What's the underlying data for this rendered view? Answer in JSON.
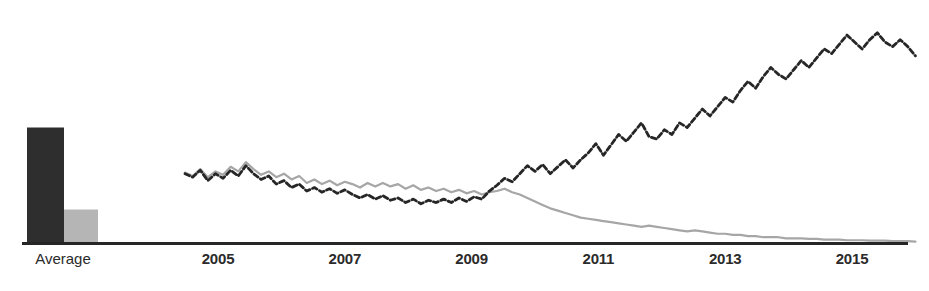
{
  "chart_data": {
    "type": "line",
    "title": "",
    "subtitle": "",
    "xlabel": "",
    "ylabel": "",
    "grid": false,
    "legend_position": "none",
    "xlim": [
      2004.0,
      2016.3
    ],
    "ylim": [
      0,
      100
    ],
    "axis_line_color": "#262626",
    "colors": {
      "series_dark": "#262626",
      "series_light": "#a6a6a6",
      "bar_dark": "#2e2e2e",
      "bar_light": "#b5b5b5",
      "axis": "#262626",
      "text": "#2b2b2b"
    },
    "x_tick_labels": [
      "2005",
      "2007",
      "2009",
      "2011",
      "2013",
      "2015"
    ],
    "x_tick_values": [
      2005,
      2007,
      2009,
      2011,
      2013,
      2015
    ],
    "category_labels": [
      "Average"
    ],
    "bars": {
      "name": "Average",
      "categories": [
        "Average"
      ],
      "series": [
        {
          "name": "Dark series average",
          "values": [
            50.0
          ]
        },
        {
          "name": "Light series average",
          "values": [
            14.5
          ]
        }
      ]
    },
    "series": [
      {
        "name": "Dark dashed series",
        "style": "dashed",
        "color": "#262626",
        "x": [
          2004.48,
          2004.6,
          2004.72,
          2004.84,
          2004.96,
          2005.08,
          2005.2,
          2005.32,
          2005.44,
          2005.56,
          2005.68,
          2005.8,
          2005.92,
          2006.04,
          2006.16,
          2006.28,
          2006.4,
          2006.52,
          2006.64,
          2006.76,
          2006.88,
          2007.0,
          2007.12,
          2007.24,
          2007.36,
          2007.48,
          2007.6,
          2007.72,
          2007.84,
          2007.96,
          2008.08,
          2008.2,
          2008.32,
          2008.44,
          2008.56,
          2008.68,
          2008.8,
          2008.92,
          2009.04,
          2009.16,
          2009.28,
          2009.4,
          2009.52,
          2009.64,
          2009.76,
          2009.88,
          2010.0,
          2010.12,
          2010.24,
          2010.36,
          2010.48,
          2010.6,
          2010.72,
          2010.84,
          2010.96,
          2011.08,
          2011.2,
          2011.32,
          2011.44,
          2011.56,
          2011.68,
          2011.8,
          2011.92,
          2012.04,
          2012.16,
          2012.28,
          2012.4,
          2012.52,
          2012.64,
          2012.76,
          2012.88,
          2013.0,
          2013.12,
          2013.24,
          2013.36,
          2013.48,
          2013.6,
          2013.72,
          2013.84,
          2013.96,
          2014.08,
          2014.2,
          2014.32,
          2014.44,
          2014.56,
          2014.68,
          2014.8,
          2014.92,
          2015.04,
          2015.16,
          2015.28,
          2015.4,
          2015.52,
          2015.64,
          2015.76,
          2015.88,
          2016.0
        ],
        "y": [
          30.0,
          28.5,
          31.5,
          27.0,
          30.0,
          28.0,
          31.5,
          29.0,
          33.5,
          30.0,
          27.5,
          29.0,
          25.5,
          27.0,
          24.0,
          25.5,
          22.5,
          24.0,
          22.0,
          23.5,
          21.5,
          23.0,
          21.0,
          19.5,
          21.0,
          19.0,
          20.5,
          18.5,
          19.5,
          17.5,
          19.0,
          17.0,
          18.5,
          17.5,
          19.0,
          17.5,
          19.5,
          18.0,
          20.0,
          19.0,
          22.5,
          25.0,
          28.0,
          26.5,
          30.0,
          33.5,
          31.0,
          34.0,
          30.0,
          33.0,
          36.0,
          32.5,
          36.0,
          39.0,
          43.0,
          38.0,
          42.5,
          47.0,
          44.0,
          48.0,
          52.0,
          46.0,
          45.0,
          49.0,
          47.0,
          52.0,
          50.0,
          54.0,
          58.0,
          55.0,
          59.0,
          63.0,
          61.0,
          66.0,
          70.0,
          67.0,
          72.0,
          76.0,
          73.0,
          71.0,
          75.0,
          79.0,
          76.0,
          80.0,
          84.0,
          82.0,
          86.0,
          90.0,
          87.0,
          84.0,
          88.0,
          91.0,
          87.0,
          85.0,
          88.0,
          85.0,
          81.0
        ]
      },
      {
        "name": "Light solid series",
        "style": "solid",
        "color": "#a6a6a6",
        "x": [
          2004.48,
          2004.6,
          2004.72,
          2004.84,
          2004.96,
          2005.08,
          2005.2,
          2005.32,
          2005.44,
          2005.56,
          2005.68,
          2005.8,
          2005.92,
          2006.04,
          2006.16,
          2006.28,
          2006.4,
          2006.52,
          2006.64,
          2006.76,
          2006.88,
          2007.0,
          2007.12,
          2007.24,
          2007.36,
          2007.48,
          2007.6,
          2007.72,
          2007.84,
          2007.96,
          2008.08,
          2008.2,
          2008.32,
          2008.44,
          2008.56,
          2008.68,
          2008.8,
          2008.92,
          2009.04,
          2009.16,
          2009.28,
          2009.4,
          2009.52,
          2009.64,
          2009.76,
          2009.88,
          2010.0,
          2010.12,
          2010.24,
          2010.36,
          2010.48,
          2010.6,
          2010.72,
          2010.84,
          2010.96,
          2011.08,
          2011.2,
          2011.32,
          2011.44,
          2011.56,
          2011.68,
          2011.8,
          2011.92,
          2012.04,
          2012.16,
          2012.28,
          2012.4,
          2012.52,
          2012.64,
          2012.76,
          2012.88,
          2013.0,
          2013.12,
          2013.24,
          2013.36,
          2013.48,
          2013.6,
          2013.72,
          2013.84,
          2013.96,
          2014.08,
          2014.2,
          2014.32,
          2014.44,
          2014.56,
          2014.68,
          2014.8,
          2014.92,
          2015.04,
          2015.16,
          2015.28,
          2015.4,
          2015.52,
          2015.64,
          2015.76,
          2015.88,
          2016.0
        ],
        "y": [
          30.5,
          29.0,
          32.0,
          28.5,
          31.0,
          29.5,
          33.0,
          31.0,
          35.0,
          32.0,
          29.5,
          31.0,
          28.5,
          30.0,
          27.5,
          29.0,
          26.0,
          27.5,
          25.5,
          27.0,
          25.0,
          26.5,
          25.5,
          24.0,
          26.0,
          24.5,
          26.0,
          24.5,
          25.5,
          23.5,
          25.0,
          23.0,
          24.0,
          22.5,
          23.5,
          22.0,
          23.0,
          21.5,
          22.5,
          21.0,
          22.0,
          22.5,
          23.5,
          22.0,
          21.0,
          19.5,
          18.0,
          16.5,
          15.0,
          14.0,
          13.0,
          12.0,
          11.0,
          10.5,
          10.0,
          9.5,
          9.0,
          8.5,
          8.0,
          7.5,
          7.0,
          7.5,
          7.0,
          6.5,
          6.0,
          5.5,
          5.0,
          5.5,
          5.0,
          4.5,
          4.0,
          4.0,
          3.5,
          3.5,
          3.0,
          3.0,
          2.5,
          2.5,
          2.5,
          2.0,
          2.0,
          2.0,
          1.8,
          1.8,
          1.5,
          1.5,
          1.5,
          1.2,
          1.2,
          1.2,
          1.0,
          1.0,
          1.0,
          0.8,
          0.8,
          0.8,
          0.6
        ]
      }
    ]
  }
}
